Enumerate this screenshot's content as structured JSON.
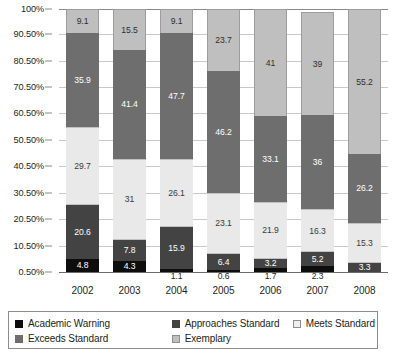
{
  "chart_data": {
    "type": "bar",
    "subtype": "stacked-bar-100",
    "title": "",
    "xlabel": "",
    "ylabel": "",
    "categories": [
      "2002",
      "2003",
      "2004",
      "2005",
      "2006",
      "2007",
      "2008"
    ],
    "ylim": [
      0.5,
      100
    ],
    "grid": true,
    "legend_position": "bottom",
    "ytick_labels": [
      "100%",
      "90.50%",
      "80.50%",
      "70.50%",
      "60.50%",
      "50.50%",
      "40.50%",
      "30.50%",
      "20.50%",
      "10.50%",
      "0.50%"
    ],
    "series": [
      {
        "name": "Academic Warning",
        "color": "#0d0d0d",
        "values": [
          4.8,
          4.3,
          1.1,
          0.6,
          1.7,
          2.3,
          0.0
        ],
        "labels": [
          "4.8",
          "4.3",
          "1.1",
          "0.6",
          "1.7",
          "2.3",
          ""
        ],
        "label_placement": [
          "inside",
          "inside",
          "outside",
          "outside",
          "outside",
          "outside",
          "none"
        ]
      },
      {
        "name": "Approaches Standard",
        "color": "#434343",
        "values": [
          20.6,
          7.8,
          15.9,
          6.4,
          3.2,
          5.2,
          3.3
        ],
        "labels": [
          "20.6",
          "7.8",
          "15.9",
          "6.4",
          "3.2",
          "5.2",
          "3.3"
        ],
        "label_placement": [
          "inside",
          "inside",
          "inside",
          "inside",
          "inside",
          "inside",
          "inside"
        ]
      },
      {
        "name": "Meets Standard",
        "color": "#e9e9e9",
        "values": [
          29.7,
          31.0,
          26.1,
          23.1,
          21.9,
          16.3,
          15.3
        ],
        "labels": [
          "29.7",
          "31",
          "26.1",
          "23.1",
          "21.9",
          "16.3",
          "15.3"
        ],
        "label_placement": [
          "inside",
          "inside",
          "inside",
          "inside",
          "inside",
          "inside",
          "inside"
        ]
      },
      {
        "name": "Exceeds Standard",
        "color": "#6e6e6e",
        "values": [
          35.9,
          41.4,
          47.7,
          46.2,
          33.1,
          36.0,
          26.2
        ],
        "labels": [
          "35.9",
          "41.4",
          "47.7",
          "46.2",
          "33.1",
          "36",
          "26.2"
        ],
        "label_placement": [
          "inside",
          "inside",
          "inside",
          "inside",
          "inside",
          "inside",
          "inside"
        ]
      },
      {
        "name": "Exemplary",
        "color": "#bfbfbf",
        "values": [
          9.1,
          15.5,
          9.1,
          23.7,
          41.0,
          39.0,
          55.2
        ],
        "labels": [
          "9.1",
          "15.5",
          "9.1",
          "23.7",
          "41",
          "39",
          "55.2"
        ],
        "label_placement": [
          "inside",
          "inside",
          "inside",
          "inside",
          "inside",
          "inside",
          "inside"
        ]
      }
    ]
  },
  "axis": {
    "y_ticks": [
      {
        "label": "100%",
        "value": 100
      },
      {
        "label": "90.50%",
        "value": 90.5
      },
      {
        "label": "80.50%",
        "value": 80.5
      },
      {
        "label": "70.50%",
        "value": 70.5
      },
      {
        "label": "60.50%",
        "value": 60.5
      },
      {
        "label": "50.50%",
        "value": 50.5
      },
      {
        "label": "40.50%",
        "value": 40.5
      },
      {
        "label": "30.50%",
        "value": 30.5
      },
      {
        "label": "20.50%",
        "value": 20.5
      },
      {
        "label": "10.50%",
        "value": 10.5
      },
      {
        "label": "0.50%",
        "value": 0.5
      }
    ]
  },
  "legend": {
    "items": [
      {
        "label": "Academic Warning",
        "swatch": "sw-academic",
        "column": "col1"
      },
      {
        "label": "Approaches Standard",
        "swatch": "sw-approaches",
        "column": "col2"
      },
      {
        "label": "Meets Standard",
        "swatch": "sw-meets",
        "column": "col3"
      },
      {
        "label": "Exceeds Standard",
        "swatch": "sw-exceeds",
        "column": "col1"
      },
      {
        "label": "Exemplary",
        "swatch": "sw-exemplary",
        "column": "col2"
      }
    ]
  }
}
